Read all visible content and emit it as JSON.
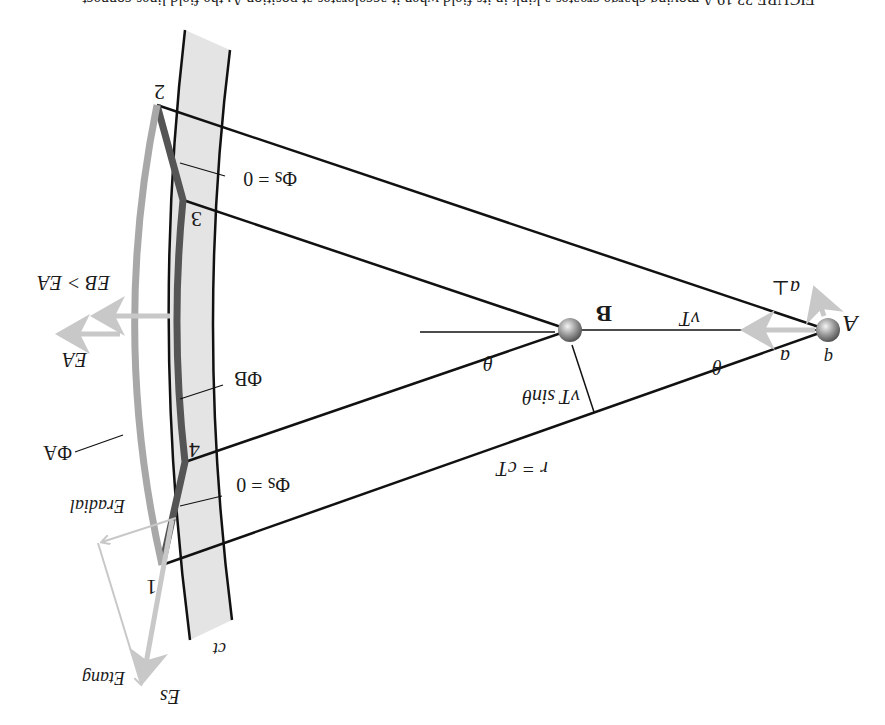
{
  "caption": {
    "text": "FIGURE 33.19  A moving charge creates a kink in its field when it accelerates at position A; the field lines connect..."
  },
  "figure": {
    "orientation": "rotated 180 degrees",
    "charge_label": "q",
    "points": {
      "A": "A",
      "B": "B",
      "p1": "1",
      "p2": "2",
      "p3": "3",
      "p4": "4"
    },
    "labels": {
      "a_vec": "a",
      "a_perp": "a⊥",
      "vT": "vT",
      "theta_A": "θ",
      "theta_B": "θ",
      "vT_sin": "vT sinθ",
      "r_eq": "r = cT",
      "ct": "ct",
      "phi_s_top": "Φs = 0",
      "phi_s_bottom": "Φs = 0",
      "phi_A": "ΦA",
      "phi_B": "ΦB",
      "E_A": "EA",
      "E_B_gt": "EB > EA",
      "E_s": "Es",
      "E_tang": "Etang",
      "E_radial": "Eradial"
    },
    "colors": {
      "band_fill": "#e4e4e4",
      "line": "#111111",
      "surface_dark": "#555555",
      "surface_light": "#a8a8a8",
      "vector": "#c8c8c8",
      "charge": "#8a8a8a"
    }
  }
}
